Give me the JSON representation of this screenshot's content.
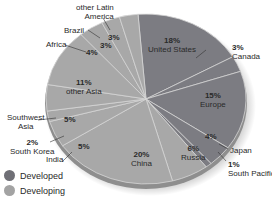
{
  "chart_data": {
    "type": "pie",
    "title": "",
    "legend": [
      {
        "label": "Developed",
        "color": "#7c7c82"
      },
      {
        "label": "Developing",
        "color": "#a8a8a8"
      }
    ],
    "legend_position": "bottom-left",
    "slices": [
      {
        "label": "United States",
        "value": 18,
        "group": "Developed"
      },
      {
        "label": "Canada",
        "value": 3,
        "group": "Developed"
      },
      {
        "label": "Europe",
        "value": 15,
        "group": "Developed"
      },
      {
        "label": "Japan",
        "value": 4,
        "group": "Developed"
      },
      {
        "label": "South Pacific",
        "value": 1,
        "group": "Developed"
      },
      {
        "label": "Russia",
        "value": 6,
        "group": "Developing"
      },
      {
        "label": "China",
        "value": 20,
        "group": "Developing"
      },
      {
        "label": "India",
        "value": 5,
        "group": "Developing"
      },
      {
        "label": "South Korea",
        "value": 2,
        "group": "Developing"
      },
      {
        "label": "Southwest Asia",
        "value": 5,
        "group": "Developing"
      },
      {
        "label": "other Asia",
        "value": 11,
        "group": "Developing"
      },
      {
        "label": "Africa",
        "value": 4,
        "group": "Developing"
      },
      {
        "label": "Brazil",
        "value": 3,
        "group": "Developing"
      },
      {
        "label": "other Latin America",
        "value": 3,
        "group": "Developing"
      }
    ]
  },
  "labels": {
    "us": {
      "pct": "18%",
      "name": "United States"
    },
    "canada": {
      "pct": "3%",
      "name": "Canada"
    },
    "europe": {
      "pct": "15%",
      "name": "Europe"
    },
    "japan": {
      "pct": "4%",
      "name": "Japan"
    },
    "south_pacific": {
      "pct": "1%",
      "name": "South Pacific"
    },
    "russia": {
      "pct": "6%",
      "name": "Russia"
    },
    "china": {
      "pct": "20%",
      "name": "China"
    },
    "india": {
      "pct": "5%",
      "name": "India"
    },
    "south_korea": {
      "pct": "2%",
      "name": "South Korea"
    },
    "southwest_asia": {
      "pct": "5%",
      "name1": "Southwest",
      "name2": "Asia"
    },
    "other_asia": {
      "pct": "11%",
      "name": "other Asia"
    },
    "africa": {
      "pct": "4%",
      "name": "Africa"
    },
    "brazil": {
      "pct": "3%",
      "name": "Brazil"
    },
    "other_latin_america": {
      "pct": "3%",
      "name1": "other Latin",
      "name2": "America"
    }
  },
  "legend": {
    "developed": "Developed",
    "developing": "Developing"
  }
}
